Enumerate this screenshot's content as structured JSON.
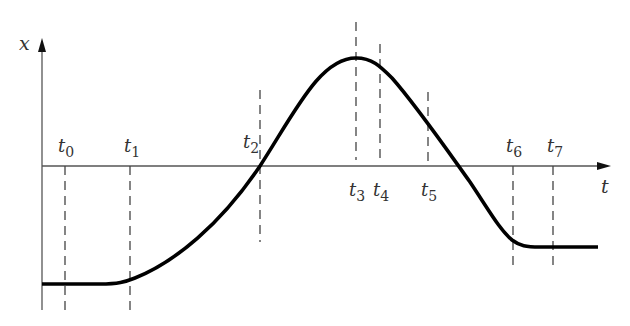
{
  "diagram": {
    "type": "position-time graph",
    "axes": {
      "y_label": "x",
      "x_label": "t"
    },
    "time_markers": [
      {
        "label": "t",
        "sub": "0",
        "x": 65,
        "label_pos": "above"
      },
      {
        "label": "t",
        "sub": "1",
        "x": 130,
        "label_pos": "above"
      },
      {
        "label": "t",
        "sub": "2",
        "x": 260,
        "label_pos": "above"
      },
      {
        "label": "t",
        "sub": "3",
        "x": 356,
        "label_pos": "below"
      },
      {
        "label": "t",
        "sub": "4",
        "x": 380,
        "label_pos": "below"
      },
      {
        "label": "t",
        "sub": "5",
        "x": 428,
        "label_pos": "below"
      },
      {
        "label": "t",
        "sub": "6",
        "x": 513,
        "label_pos": "above"
      },
      {
        "label": "t",
        "sub": "7",
        "x": 553,
        "label_pos": "above"
      }
    ],
    "curve_description": "Constant negative x from t0 to t1, increasing through zero at t2, maximum at t3, decreasing through zero after t5, leveling to constant negative value at t6 through t7",
    "colors": {
      "curve": "#000000",
      "axes": "#555555",
      "dashes": "#444444"
    }
  }
}
